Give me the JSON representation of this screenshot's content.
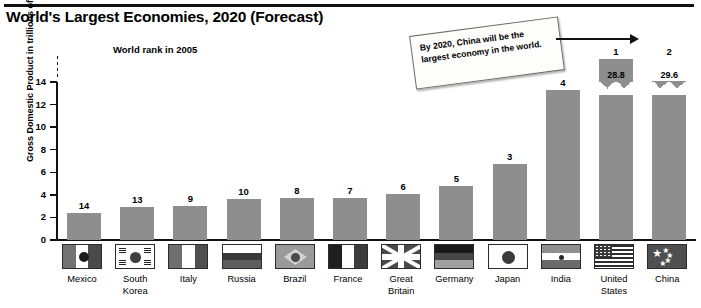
{
  "header": {
    "title": "World's Largest Economies, 2020 (Forecast)",
    "subtitle": "World rank in 2005"
  },
  "annotation": {
    "text": "By 2020, China will be the largest economy in the world.",
    "arrow": "arrow-to-china"
  },
  "chart_data": {
    "type": "bar",
    "title": "World's Largest Economies, 2020 (Forecast)",
    "subtitle": "World rank in 2005",
    "xlabel": "",
    "ylabel": "Gross Domestic Product in trillions of dollars",
    "ylim": [
      0,
      14
    ],
    "yticks": [
      0,
      2,
      4,
      6,
      8,
      10,
      12,
      14
    ],
    "grid": false,
    "legend": "none",
    "axis_break": true,
    "axis_break_note": "United States and China bars are truncated with a zig-zag break; their true values are labelled on the bar.",
    "categories": [
      "Mexico",
      "South Korea",
      "Italy",
      "Russia",
      "Brazil",
      "France",
      "Great Britain",
      "Germany",
      "Japan",
      "India",
      "United States",
      "China"
    ],
    "values": [
      2.4,
      2.9,
      3.0,
      3.6,
      3.7,
      3.7,
      4.1,
      4.8,
      6.7,
      13.3,
      28.8,
      29.6
    ],
    "rank_labels": [
      "14",
      "13",
      "9",
      "10",
      "8",
      "7",
      "6",
      "5",
      "3",
      "4",
      "1",
      "2"
    ],
    "value_labels": [
      "",
      "",
      "",
      "",
      "",
      "",
      "",
      "",
      "",
      "",
      "28.8",
      "29.6"
    ],
    "bar_color": "#8e8e8e",
    "series": [
      {
        "name": "GDP 2020 forecast (trillions of dollars)",
        "values": [
          2.4,
          2.9,
          3.0,
          3.6,
          3.7,
          3.7,
          4.1,
          4.8,
          6.7,
          13.3,
          28.8,
          29.6
        ]
      }
    ]
  },
  "countries": [
    {
      "name_line1": "Mexico",
      "name_line2": "",
      "flag": "flag-mexico-icon",
      "rank": "14",
      "value": 2.4
    },
    {
      "name_line1": "South",
      "name_line2": "Korea",
      "flag": "flag-south-korea-icon",
      "rank": "13",
      "value": 2.9
    },
    {
      "name_line1": "Italy",
      "name_line2": "",
      "flag": "flag-italy-icon",
      "rank": "9",
      "value": 3.0
    },
    {
      "name_line1": "Russia",
      "name_line2": "",
      "flag": "flag-russia-icon",
      "rank": "10",
      "value": 3.6
    },
    {
      "name_line1": "Brazil",
      "name_line2": "",
      "flag": "flag-brazil-icon",
      "rank": "8",
      "value": 3.7
    },
    {
      "name_line1": "France",
      "name_line2": "",
      "flag": "flag-france-icon",
      "rank": "7",
      "value": 3.7
    },
    {
      "name_line1": "Great",
      "name_line2": "Britain",
      "flag": "flag-great-britain-icon",
      "rank": "6",
      "value": 4.1
    },
    {
      "name_line1": "Germany",
      "name_line2": "",
      "flag": "flag-germany-icon",
      "rank": "5",
      "value": 4.8
    },
    {
      "name_line1": "Japan",
      "name_line2": "",
      "flag": "flag-japan-icon",
      "rank": "3",
      "value": 6.7
    },
    {
      "name_line1": "India",
      "name_line2": "",
      "flag": "flag-india-icon",
      "rank": "4",
      "value": 13.3
    },
    {
      "name_line1": "United",
      "name_line2": "States",
      "flag": "flag-united-states-icon",
      "rank": "1",
      "value": 28.8
    },
    {
      "name_line1": "China",
      "name_line2": "",
      "flag": "flag-china-icon",
      "rank": "2",
      "value": 29.6
    }
  ],
  "axis": {
    "ticks": [
      "14",
      "12",
      "10",
      "8",
      "6",
      "4",
      "2",
      "0"
    ],
    "label": "Gross Domestic Product in trillions of dollars"
  }
}
